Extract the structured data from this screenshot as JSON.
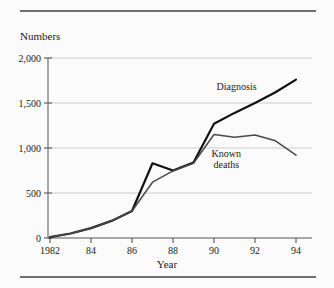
{
  "figure": {
    "y_axis_title": "Numbers",
    "x_axis_title": "Year"
  },
  "chart_data": {
    "type": "line",
    "title": "",
    "xlabel": "Year",
    "ylabel": "Numbers",
    "xlim": [
      1982,
      1994
    ],
    "ylim": [
      0,
      2000
    ],
    "grid": true,
    "legend_position": "inline-annotation",
    "x": [
      1982,
      1983,
      1984,
      1985,
      1986,
      1987,
      1988,
      1989,
      1990,
      1991,
      1992,
      1993,
      1994
    ],
    "x_tick_labels": [
      "1982",
      "",
      "84",
      "",
      "86",
      "",
      "88",
      "",
      "90",
      "",
      "92",
      "",
      "94"
    ],
    "y_ticks": [
      0,
      500,
      1000,
      1500,
      2000
    ],
    "y_tick_labels": [
      "0",
      "500",
      "1,000",
      "1,500",
      "2,000"
    ],
    "series": [
      {
        "name": "Diagnosis",
        "color": "#111111",
        "width": 2.2,
        "label_x": 1991.1,
        "label_y": 1640,
        "values": [
          10,
          50,
          110,
          190,
          300,
          830,
          750,
          840,
          1270,
          1390,
          1500,
          1620,
          1760
        ]
      },
      {
        "name": "Known deaths",
        "color": "#4a4a4a",
        "width": 1.5,
        "label_line1": "Known",
        "label_line2": "deaths",
        "label_x": 1990.6,
        "label_y": 900,
        "values": [
          10,
          50,
          110,
          190,
          300,
          620,
          745,
          830,
          1150,
          1120,
          1145,
          1080,
          920
        ]
      }
    ]
  }
}
